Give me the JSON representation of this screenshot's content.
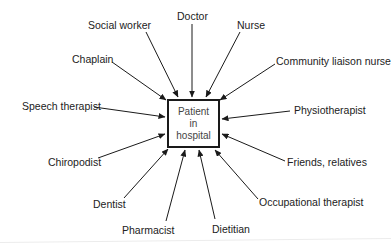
{
  "center": {
    "lines": [
      "Patient",
      "in",
      "hospital"
    ]
  },
  "roles": [
    {
      "id": "doctor",
      "label": "Doctor"
    },
    {
      "id": "social-worker",
      "label": "Social worker"
    },
    {
      "id": "nurse",
      "label": "Nurse"
    },
    {
      "id": "chaplain",
      "label": "Chaplain"
    },
    {
      "id": "community-liaison-nurse",
      "label": "Community liaison nurse"
    },
    {
      "id": "speech-therapist",
      "label": "Speech therapist"
    },
    {
      "id": "physiotherapist",
      "label": "Physiotherapist"
    },
    {
      "id": "chiropodist",
      "label": "Chiropodist"
    },
    {
      "id": "friends-relatives",
      "label": "Friends, relatives"
    },
    {
      "id": "dentist",
      "label": "Dentist"
    },
    {
      "id": "occupational-therapist",
      "label": "Occupational therapist"
    },
    {
      "id": "pharmacist",
      "label": "Pharmacist"
    },
    {
      "id": "dietitian",
      "label": "Dietitian"
    }
  ],
  "colors": {
    "line": "#1a1a1a",
    "text": "#222222"
  }
}
